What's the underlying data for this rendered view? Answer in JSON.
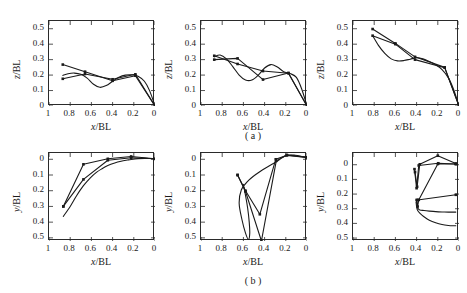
{
  "figure": {
    "caption_a": "( a )",
    "caption_b": "( b )",
    "axis_color": "#2a2a2a",
    "series_color": "#1a1a1a"
  },
  "axes": {
    "x_ticks": [
      "1",
      "0.8",
      "0.6",
      "0.4",
      "0.2",
      "0"
    ],
    "x_tick_values": [
      1,
      0.8,
      0.6,
      0.4,
      0.2,
      0
    ],
    "y_ticks_top": [
      "0",
      "0.1",
      "0.2",
      "0.3",
      "0.4",
      "0.5"
    ],
    "y_tick_values_top": [
      0,
      0.1,
      0.2,
      0.3,
      0.4,
      0.5
    ],
    "y_ticks_bottom": [
      "0",
      "0.1",
      "0.2",
      "0.3",
      "0.4",
      "0.5"
    ],
    "y_tick_values_bottom": [
      0,
      0.1,
      0.2,
      0.3,
      0.4,
      0.5
    ],
    "xlabel_num": "x",
    "xlabel_den": "/BL",
    "ylabel_top_num": "z",
    "ylabel_top_den": "/BL",
    "ylabel_bottom_num": "y",
    "ylabel_bottom_den": "/BL"
  },
  "chart_data": [
    {
      "id": "a1",
      "type": "line",
      "title": "",
      "xlabel": "x/BL",
      "ylabel": "z/BL",
      "xlim": [
        1,
        0
      ],
      "ylim": [
        0,
        0.55
      ],
      "xticks": [
        1,
        0.8,
        0.6,
        0.4,
        0.2,
        0
      ],
      "yticks": [
        0,
        0.1,
        0.2,
        0.3,
        0.4,
        0.5
      ],
      "grid": false,
      "legend": "none",
      "series": [
        {
          "name": "curve-1",
          "marker": true,
          "x": [
            0.87,
            0.66,
            0.4,
            0.185,
            0.0
          ],
          "y": [
            0.268,
            0.222,
            0.163,
            0.196,
            0.0
          ]
        },
        {
          "name": "curve-2",
          "marker": true,
          "x": [
            0.87,
            0.66,
            0.4,
            0.185,
            0.0
          ],
          "y": [
            0.176,
            0.207,
            0.173,
            0.205,
            0.0
          ]
        },
        {
          "name": "curve-3-smooth",
          "marker": false,
          "x": [
            0.87,
            0.82,
            0.76,
            0.7,
            0.64,
            0.58,
            0.52,
            0.46,
            0.4,
            0.34,
            0.28,
            0.22,
            0.16,
            0.1,
            0.05,
            0.0
          ],
          "y": [
            0.198,
            0.209,
            0.213,
            0.205,
            0.18,
            0.141,
            0.121,
            0.132,
            0.16,
            0.186,
            0.2,
            0.202,
            0.193,
            0.16,
            0.098,
            0.0
          ]
        }
      ]
    },
    {
      "id": "a2",
      "type": "line",
      "title": "",
      "xlabel": "x/BL",
      "ylabel": "z/BL",
      "xlim": [
        1,
        0
      ],
      "ylim": [
        0,
        0.55
      ],
      "xticks": [
        1,
        0.8,
        0.6,
        0.4,
        0.2,
        0
      ],
      "yticks": [
        0,
        0.1,
        0.2,
        0.3,
        0.4,
        0.5
      ],
      "grid": false,
      "legend": "none",
      "series": [
        {
          "name": "curve-1",
          "marker": true,
          "x": [
            0.875,
            0.655,
            0.415,
            0.175,
            0.0
          ],
          "y": [
            0.325,
            0.272,
            0.226,
            0.212,
            0.0
          ]
        },
        {
          "name": "curve-2",
          "marker": true,
          "x": [
            0.875,
            0.655,
            0.415,
            0.175,
            0.0
          ],
          "y": [
            0.3,
            0.308,
            0.171,
            0.214,
            0.0
          ]
        },
        {
          "name": "curve-3-smooth",
          "marker": false,
          "x": [
            0.875,
            0.82,
            0.76,
            0.7,
            0.64,
            0.58,
            0.52,
            0.46,
            0.4,
            0.34,
            0.28,
            0.22,
            0.16,
            0.1,
            0.05,
            0.0
          ],
          "y": [
            0.318,
            0.33,
            0.305,
            0.255,
            0.2,
            0.168,
            0.168,
            0.2,
            0.246,
            0.268,
            0.252,
            0.222,
            0.21,
            0.185,
            0.11,
            0.0
          ]
        }
      ]
    },
    {
      "id": "a3",
      "type": "line",
      "title": "",
      "xlabel": "x/BL",
      "ylabel": "z/BL",
      "xlim": [
        1,
        0
      ],
      "ylim": [
        0,
        0.55
      ],
      "xticks": [
        1,
        0.8,
        0.6,
        0.4,
        0.2,
        0
      ],
      "yticks": [
        0,
        0.1,
        0.2,
        0.3,
        0.4,
        0.5
      ],
      "grid": false,
      "legend": "none",
      "series": [
        {
          "name": "curve-1",
          "marker": true,
          "x": [
            0.815,
            0.6,
            0.415,
            0.135,
            0.0
          ],
          "y": [
            0.498,
            0.405,
            0.318,
            0.25,
            0.0
          ]
        },
        {
          "name": "curve-2",
          "marker": true,
          "x": [
            0.815,
            0.6,
            0.415,
            0.135,
            0.0
          ],
          "y": [
            0.455,
            0.4,
            0.3,
            0.248,
            0.0
          ]
        },
        {
          "name": "curve-3-smooth",
          "marker": false,
          "x": [
            0.815,
            0.76,
            0.7,
            0.64,
            0.58,
            0.52,
            0.46,
            0.4,
            0.34,
            0.28,
            0.22,
            0.16,
            0.1,
            0.05,
            0.0
          ],
          "y": [
            0.455,
            0.392,
            0.34,
            0.305,
            0.292,
            0.294,
            0.303,
            0.312,
            0.305,
            0.288,
            0.266,
            0.236,
            0.182,
            0.105,
            0.0
          ]
        }
      ]
    },
    {
      "id": "b1",
      "type": "line",
      "title": "",
      "xlabel": "x/BL",
      "ylabel": "y/BL",
      "xlim": [
        1,
        0
      ],
      "ylim": [
        -0.52,
        0.04
      ],
      "y_axis_sign": "inverted-labels",
      "xticks": [
        1,
        0.8,
        0.6,
        0.4,
        0.2,
        0
      ],
      "yticks": [
        0,
        -0.1,
        -0.2,
        -0.3,
        -0.4,
        -0.5
      ],
      "grid": false,
      "legend": "none",
      "series": [
        {
          "name": "curve-1",
          "marker": true,
          "x": [
            0.865,
            0.675,
            0.445,
            0.225,
            0.0
          ],
          "y": [
            -0.3,
            -0.032,
            0.003,
            0.018,
            0.003
          ]
        },
        {
          "name": "curve-2",
          "marker": true,
          "x": [
            0.865,
            0.675,
            0.445,
            0.225,
            0.0
          ],
          "y": [
            -0.3,
            -0.128,
            -0.006,
            0.01,
            0.003
          ]
        },
        {
          "name": "curve-3-smooth",
          "marker": false,
          "x": [
            0.865,
            0.8,
            0.74,
            0.675,
            0.61,
            0.55,
            0.5,
            0.445,
            0.38,
            0.32,
            0.26,
            0.225,
            0.16,
            0.1,
            0.05,
            0.0
          ],
          "y": [
            -0.363,
            -0.3,
            -0.232,
            -0.168,
            -0.118,
            -0.082,
            -0.06,
            -0.04,
            -0.024,
            -0.013,
            -0.005,
            -0.001,
            0.004,
            0.006,
            0.005,
            0.003
          ]
        }
      ]
    },
    {
      "id": "b2",
      "type": "line",
      "title": "",
      "xlabel": "x/BL",
      "ylabel": "y/BL",
      "xlim": [
        1,
        0
      ],
      "ylim": [
        -0.52,
        0.04
      ],
      "y_axis_sign": "inverted-labels",
      "xticks": [
        1,
        0.8,
        0.6,
        0.4,
        0.2,
        0
      ],
      "yticks": [
        0,
        -0.1,
        -0.2,
        -0.3,
        -0.4,
        -0.5
      ],
      "grid": false,
      "legend": "none",
      "series": [
        {
          "name": "curve-1",
          "marker": true,
          "x": [
            0.655,
            0.58,
            0.445,
            0.295,
            0.19,
            0.0
          ],
          "y": [
            -0.1,
            -0.2,
            -0.35,
            0.0,
            0.025,
            0.012
          ]
        },
        {
          "name": "curve-2",
          "marker": true,
          "x": [
            0.655,
            0.58,
            0.43,
            0.29,
            0.19,
            0.0
          ],
          "y": [
            -0.1,
            -0.205,
            -0.52,
            -0.01,
            0.028,
            0.012
          ]
        },
        {
          "name": "curve-3-smooth",
          "marker": false,
          "x": [
            0.6,
            0.58,
            0.56,
            0.545,
            0.54,
            0.552,
            0.58,
            0.615,
            0.64,
            0.62,
            0.56,
            0.48,
            0.39,
            0.3,
            0.2,
            0.11,
            0.05,
            0.0
          ],
          "y": [
            -0.16,
            -0.23,
            -0.31,
            -0.4,
            -0.47,
            -0.51,
            -0.47,
            -0.38,
            -0.28,
            -0.195,
            -0.14,
            -0.095,
            -0.055,
            -0.02,
            0.022,
            0.026,
            0.018,
            0.012
          ]
        }
      ]
    },
    {
      "id": "b3",
      "type": "line",
      "title": "",
      "xlabel": "x/BL",
      "ylabel": "y/BL",
      "xlim": [
        1,
        0
      ],
      "ylim": [
        -0.52,
        0.08
      ],
      "y_axis_sign": "inverted-labels",
      "xticks": [
        1,
        0.8,
        0.6,
        0.4,
        0.2,
        0
      ],
      "yticks": [
        0,
        -0.1,
        -0.2,
        -0.3,
        -0.4,
        -0.5
      ],
      "grid": false,
      "legend": "none",
      "series": [
        {
          "name": "curve-1",
          "marker": true,
          "x": [
            0.415,
            0.395,
            0.37,
            0.2,
            0.03
          ],
          "y": [
            -0.05,
            -0.15,
            0.003,
            0.062,
            0.008
          ]
        },
        {
          "name": "curve-2",
          "marker": true,
          "x": [
            0.42,
            0.4,
            0.38,
            0.195,
            0.03
          ],
          "y": [
            -0.03,
            -0.16,
            -0.005,
            0.01,
            0.005
          ]
        },
        {
          "name": "curve-3",
          "marker": true,
          "x": [
            0.4,
            0.39,
            0.38,
            0.2,
            0.03
          ],
          "y": [
            -0.24,
            -0.285,
            -0.24,
            0.005,
            0.005
          ]
        },
        {
          "name": "curve-4-flat",
          "marker": true,
          "x": [
            0.39,
            0.03
          ],
          "y": [
            -0.24,
            -0.205
          ]
        },
        {
          "name": "curve-5-smooth",
          "marker": false,
          "x": [
            0.4,
            0.392,
            0.385,
            0.37,
            0.33,
            0.28,
            0.22,
            0.16,
            0.1,
            0.055,
            0.03
          ],
          "y": [
            -0.25,
            -0.29,
            -0.3,
            -0.308,
            -0.312,
            -0.316,
            -0.32,
            -0.322,
            -0.323,
            -0.323,
            -0.323
          ]
        },
        {
          "name": "curve-6-smooth",
          "marker": false,
          "x": [
            0.405,
            0.398,
            0.39,
            0.37,
            0.33,
            0.28,
            0.22,
            0.16,
            0.1,
            0.055,
            0.03
          ],
          "y": [
            -0.255,
            -0.295,
            -0.312,
            -0.33,
            -0.355,
            -0.378,
            -0.396,
            -0.408,
            -0.414,
            -0.416,
            -0.416
          ]
        }
      ]
    }
  ]
}
